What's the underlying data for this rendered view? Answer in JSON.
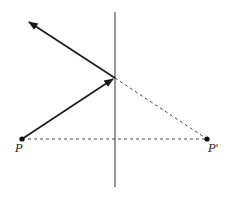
{
  "diagram": {
    "colors": {
      "line": "#1a1a1a",
      "mirror": "#555555",
      "dashed": "#333333",
      "background": "#ffffff"
    },
    "mirror": {
      "x": 115,
      "y1": 12,
      "y2": 187
    },
    "reflection_point": {
      "x": 115,
      "y": 78
    },
    "points": [
      {
        "id": "P",
        "label": "P",
        "x": 22,
        "y": 139,
        "label_x": 15,
        "label_y": 151
      },
      {
        "id": "P_prime",
        "label": "P'",
        "x": 207,
        "y": 139,
        "label_x": 208,
        "label_y": 151
      }
    ],
    "incident_ray": {
      "from": [
        22,
        139
      ],
      "to": [
        113,
        79
      ]
    },
    "reflected_ray": {
      "from": [
        115,
        78
      ],
      "to": [
        29,
        22
      ]
    },
    "dashed_lines": [
      {
        "from": [
          22,
          139
        ],
        "to": [
          207,
          139
        ]
      },
      {
        "from": [
          115,
          78
        ],
        "to": [
          207,
          139
        ]
      }
    ]
  }
}
